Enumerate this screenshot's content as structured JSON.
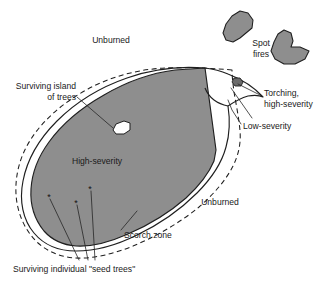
{
  "figure": {
    "type": "diagram",
    "background_color": "#ffffff",
    "line_color": "#1f1f1f",
    "high_severity_fill": "#8e8e8e",
    "spot_fire_fill": "#8e8e8e",
    "torching_fill": "#6b6b6b",
    "island_fill": "#ffffff"
  },
  "labels": {
    "unburned_top": "Unburned",
    "unburned_right": "Unburned",
    "spot_fires_line1": "Spot",
    "spot_fires_line2": "fires",
    "surviving_island_line1": "Surviving island",
    "surviving_island_line2": "of trees",
    "high_severity": "High-severity",
    "torching_line1": "Torching,",
    "torching_line2": "high-severity",
    "low_severity": "Low-severity",
    "scorch_zone": "Scorch zone",
    "seed_trees": "Surviving individual \"seed trees\""
  },
  "legend_semantics": {
    "solid_outline": "fire perimeter / low-severity boundary",
    "dashed_outline": "scorch zone boundary",
    "gray_fill": "high-severity burn area",
    "white_inclusion": "surviving island of trees",
    "asterisks": "surviving individual seed trees"
  },
  "markers": {
    "seed_tree_glyph": "*",
    "seed_tree_count": 3
  }
}
